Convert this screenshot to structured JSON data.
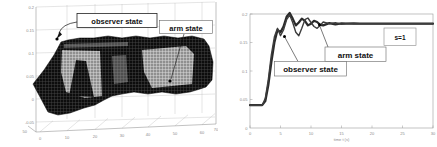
{
  "page": {
    "background": "#ffffff"
  },
  "left_figure": {
    "annotations": {
      "observer": "observer state",
      "arm": "arm state"
    },
    "z_ticks": [
      "0.2",
      "0.15",
      "0.1",
      "0.05",
      "0",
      "-0.05"
    ],
    "x_ticks": [
      "0",
      "10",
      "20",
      "30",
      "40",
      "50",
      "60"
    ],
    "corner_tick": "70",
    "depth_tick": "50"
  },
  "right_figure": {
    "annotations": {
      "observer": "observer state",
      "arm": "arm state"
    },
    "legend": "s=1",
    "y_ticks": [
      "0.2",
      "0.15",
      "0.1",
      "0.05",
      "0"
    ],
    "x_ticks": [
      "0",
      "5",
      "10",
      "15",
      "20",
      "25",
      "30"
    ],
    "xlabel": "time t (s)"
  },
  "colors": {
    "mesh_dark": "#0d0d0d",
    "mesh_light": "#8f8f8f",
    "axis_gray": "#999999",
    "grid_gray": "#bdbdbd",
    "curve_dark": "#2b2b2b"
  },
  "chart_data": [
    {
      "type": "area",
      "subtype": "3d-mesh-surface",
      "title": "",
      "description": "MATLAB-style 3D mesh: overlapping observer-state and arm-state trajectory surfaces. Flat dip near/below zero at start, steep wall rising to a sustained plateau (~0.14-0.15) with lighter high patches; callout arrows label observer state and arm state regions.",
      "zlim": [
        -0.05,
        0.2
      ],
      "z_tick_values": [
        0.2,
        0.15,
        0.1,
        0.05,
        0,
        -0.05
      ],
      "x_tick_values": [
        0,
        10,
        20,
        30,
        40,
        50,
        60,
        70
      ],
      "depth_tick_value": 50,
      "grid": true,
      "annotations": [
        "observer state",
        "arm state"
      ]
    },
    {
      "type": "line",
      "title": "",
      "xlabel": "time t (s)",
      "ylabel": "",
      "xlim": [
        0,
        30
      ],
      "ylim": [
        0,
        0.2
      ],
      "grid": false,
      "legend": "s=1",
      "legend_position": "upper right",
      "x": [
        0,
        1,
        2,
        2.5,
        3,
        3.5,
        4,
        4.5,
        5,
        5.5,
        6,
        6.5,
        7,
        7.5,
        8,
        8.5,
        9,
        9.5,
        10,
        10.5,
        11,
        11.5,
        12,
        13,
        14,
        15,
        16,
        17,
        18,
        20,
        22,
        24,
        26,
        28,
        30
      ],
      "series": [
        {
          "name": "arm state",
          "values": [
            0.04,
            0.04,
            0.04,
            0.047,
            0.075,
            0.115,
            0.15,
            0.172,
            0.168,
            0.178,
            0.195,
            0.202,
            0.192,
            0.18,
            0.185,
            0.192,
            0.188,
            0.18,
            0.183,
            0.188,
            0.186,
            0.181,
            0.18,
            0.184,
            0.182,
            0.1835,
            0.183,
            0.1835,
            0.183,
            0.183,
            0.183,
            0.183,
            0.183,
            0.183,
            0.183
          ]
        },
        {
          "name": "observer state",
          "values": [
            0.04,
            0.04,
            0.04,
            0.052,
            0.085,
            0.128,
            0.16,
            0.175,
            0.162,
            0.172,
            0.19,
            0.198,
            0.185,
            0.168,
            0.162,
            0.175,
            0.19,
            0.193,
            0.185,
            0.178,
            0.175,
            0.18,
            0.186,
            0.183,
            0.1845,
            0.182,
            0.1835,
            0.183,
            0.1832,
            0.183,
            0.183,
            0.183,
            0.183,
            0.183,
            0.183
          ]
        }
      ],
      "annotations": [
        {
          "label": "observer state",
          "target_x": 6.4,
          "target_y": 0.162
        },
        {
          "label": "arm state",
          "target_x": 11.4,
          "target_y": 0.182
        }
      ]
    }
  ]
}
